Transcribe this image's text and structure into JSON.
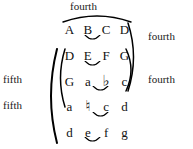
{
  "diagram": {
    "background_color": "#ffffff",
    "ink_color": "#000000"
  },
  "labels": {
    "top_fourth": "fourth",
    "right_fourth_upper": "fourth",
    "right_fourth_lower": "fourth",
    "left_fifth_upper": "fifth",
    "left_fifth_lower": "fifth"
  },
  "rows": [
    {
      "id": "row-1",
      "notes": [
        "A",
        "B",
        "C",
        "D"
      ],
      "semitone_pair": [
        1,
        2
      ]
    },
    {
      "id": "row-2",
      "notes": [
        "D",
        "E",
        "F",
        "G"
      ],
      "semitone_pair": [
        1,
        2
      ]
    },
    {
      "id": "row-3",
      "notes": [
        "G",
        "a",
        "♭",
        "c"
      ],
      "semitone_pair": [
        2,
        3
      ]
    },
    {
      "id": "row-4",
      "notes": [
        "a",
        "♮",
        "c",
        "d"
      ],
      "semitone_pair": [
        1,
        2
      ]
    },
    {
      "id": "row-5",
      "notes": [
        "d",
        "e",
        "f",
        "g"
      ],
      "semitone_pair": [
        1,
        2
      ]
    }
  ]
}
